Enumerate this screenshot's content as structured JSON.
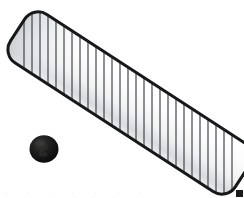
{
  "image": {
    "width": 244,
    "height": 198,
    "background_color": "#ffffff",
    "caption": "White slatted grille panel with black round knob"
  },
  "objects": {
    "grille": {
      "label": "striped-grille-panel",
      "shape": "rounded-rectangle",
      "rotation_degrees": 33,
      "body_color": "#fbfbfb",
      "shade_color": "#d8dadd",
      "outline_color": "#17181a",
      "outline_width_px": 3,
      "corner_radius_px": 16,
      "slat_color": "#3a3d42",
      "slat_count": 27,
      "slat_width_px": 1.2,
      "center_x": 130,
      "center_y": 103,
      "length_px": 268,
      "thickness_px": 58
    },
    "knob": {
      "label": "black-round-knob",
      "shape": "circle",
      "center_x": 44,
      "center_y": 148,
      "radius_px": 14,
      "fill_color": "#141414",
      "highlight_color": "#30302f",
      "shadow_color": "#050505"
    },
    "corner_mark": {
      "label": "bottom-right-square-mark",
      "shape": "square",
      "x": 236,
      "y": 190,
      "size_px": 7,
      "fill_color": "#1b1b1b"
    }
  },
  "artifacts": {
    "bottom_text_remnant": "- .  .   . .  . ."
  }
}
